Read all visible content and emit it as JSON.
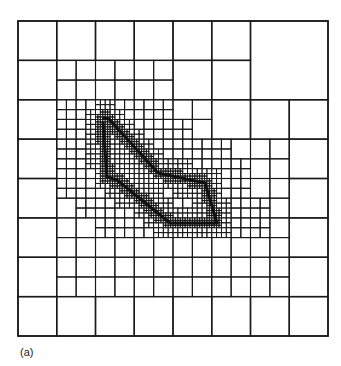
{
  "figure": {
    "caption": "(a)",
    "line_color": "#1a1a1a",
    "curve_color": "#111111",
    "background": "#ffffff"
  },
  "mesh": {
    "origin": [
      18,
      21
    ],
    "size": [
      310,
      315
    ],
    "base_grid": 8,
    "merged_blocks": [
      {
        "col": 6,
        "row": 0,
        "span": 2
      }
    ],
    "level1_split": [
      [
        1,
        1
      ],
      [
        2,
        1
      ],
      [
        3,
        1
      ],
      [
        1,
        2
      ],
      [
        2,
        2
      ],
      [
        3,
        2
      ],
      [
        4,
        2
      ],
      [
        1,
        3
      ],
      [
        2,
        3
      ],
      [
        3,
        3
      ],
      [
        4,
        3
      ],
      [
        5,
        3
      ],
      [
        6,
        3
      ],
      [
        1,
        4
      ],
      [
        2,
        4
      ],
      [
        3,
        4
      ],
      [
        4,
        4
      ],
      [
        5,
        4
      ],
      [
        6,
        4
      ],
      [
        1,
        5
      ],
      [
        2,
        5
      ],
      [
        3,
        5
      ],
      [
        4,
        5
      ],
      [
        5,
        5
      ],
      [
        6,
        5
      ],
      [
        1,
        6
      ],
      [
        2,
        6
      ],
      [
        3,
        6
      ],
      [
        4,
        6
      ],
      [
        5,
        6
      ],
      [
        6,
        6
      ]
    ],
    "level2_region": {
      "x0": 57,
      "y0": 99,
      "x1": 271,
      "y1": 256,
      "max_dist": 34
    },
    "level3_dist": 11,
    "level4_dist": 4
  },
  "curve": {
    "points": [
      [
        103,
        118
      ],
      [
        109,
        119
      ],
      [
        158,
        173
      ],
      [
        205,
        183
      ],
      [
        217,
        223
      ],
      [
        170,
        223
      ],
      [
        117,
        180
      ],
      [
        107,
        177
      ],
      [
        103,
        122
      ]
    ],
    "width": 3
  }
}
